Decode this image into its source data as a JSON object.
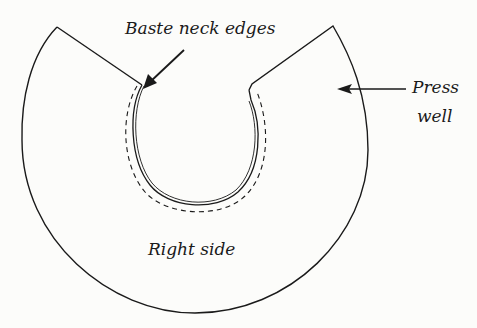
{
  "diagram": {
    "type": "sewing-illustration",
    "labels": {
      "baste": "Baste neck edges",
      "press_line1": "Press",
      "press_line2": "well",
      "side": "Right side"
    },
    "colors": {
      "line": "#1a1a1a",
      "background": "#fcfcfa"
    }
  }
}
